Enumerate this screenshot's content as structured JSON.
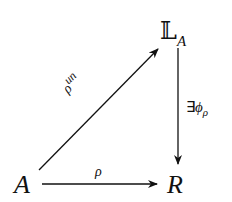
{
  "diagram": {
    "type": "commutative-triangle",
    "nodes": {
      "A": {
        "label": "A"
      },
      "R": {
        "label": "R"
      },
      "LA": {
        "base": "𝕃",
        "sub": "A"
      }
    },
    "edges": {
      "rho_un": {
        "from": "A",
        "to": "LA",
        "base": "ρ",
        "sup": "un"
      },
      "rho": {
        "from": "A",
        "to": "R",
        "label": "ρ"
      },
      "phi": {
        "from": "LA",
        "to": "R",
        "prefix": "∃",
        "base": "ϕ",
        "sub": "ρ"
      }
    },
    "colors": {
      "stroke": "#111111",
      "background": "#ffffff"
    }
  }
}
